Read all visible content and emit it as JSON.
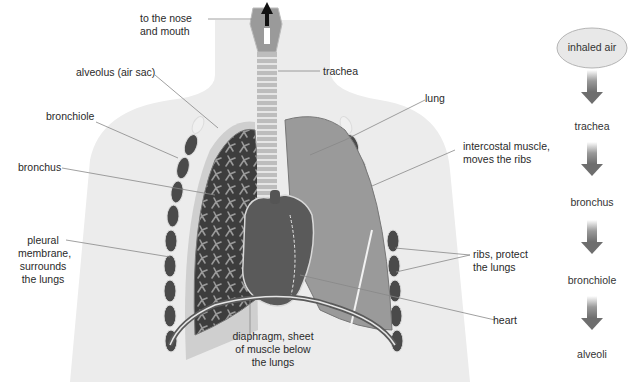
{
  "labels": {
    "nose_mouth": [
      "to the nose",
      "and mouth"
    ],
    "trachea": "trachea",
    "alveolus": "alveolus (air sac)",
    "lung": "lung",
    "bronchiole": "bronchiole",
    "intercostal": [
      "intercostal muscle,",
      "moves the ribs"
    ],
    "bronchus": "bronchus",
    "pleural": [
      "pleural",
      "membrane,",
      "surrounds",
      "the lungs"
    ],
    "ribs": [
      "ribs, protect",
      "the lungs"
    ],
    "heart": "heart",
    "diaphragm": [
      "diaphragm, sheet",
      "of muscle below",
      "the lungs"
    ]
  },
  "flow": {
    "start": "inhaled air",
    "steps": [
      "trachea",
      "bronchus",
      "bronchiole",
      "alveoli"
    ]
  },
  "colors": {
    "body": "#ececec",
    "lung_dark": "#3d3d3d",
    "lung_light": "#9a9a9a",
    "heart": "#5a5a5a",
    "rib": "#4a4a4a",
    "arrow": "#6e6e6e",
    "ellipse_fill": "#e8e8e8",
    "ellipse_stroke": "#b5b5b5",
    "leader": "#888888"
  }
}
